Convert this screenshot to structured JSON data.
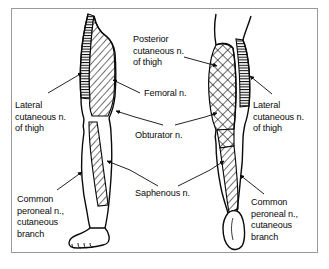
{
  "figure": {
    "view": "anterior and posterior views of both legs",
    "border_color": "#9a9a9a",
    "ink_color": "#0a0a0a",
    "background_color": "#ffffff"
  },
  "labels": {
    "posterior_cutaneous": {
      "line1": "Posterior",
      "line2": "cutaneous n.",
      "line3": "of thigh"
    },
    "lateral_cutaneous_left": {
      "line1": "Lateral",
      "line2": "cutaneous n.",
      "line3": "of thigh"
    },
    "lateral_cutaneous_right": {
      "line1": "Lateral",
      "line2": "cutaneous n.",
      "line3": "of thigh"
    },
    "femoral": {
      "line1": "Femoral n."
    },
    "obturator": {
      "line1": "Obturator n."
    },
    "saphenous": {
      "line1": "Saphenous n."
    },
    "common_peroneal_left": {
      "line1": "Common",
      "line2": "peroneal n.,",
      "line3": "cutaneous",
      "line4": "branch"
    },
    "common_peroneal_right": {
      "line1": "Common",
      "line2": "peroneal n.,",
      "line3": "cutaneous",
      "line4": "branch"
    }
  },
  "regions": [
    {
      "name": "left-thigh-lateral-band",
      "pattern": "horizontal-lines",
      "nerve": "Lateral cutaneous n. of thigh"
    },
    {
      "name": "left-thigh-femoral-area",
      "pattern": "diagonal-hatch",
      "nerve": "Femoral n."
    },
    {
      "name": "left-leg-saphenous-strip",
      "pattern": "diagonal-hatch",
      "nerve": "Saphenous n."
    },
    {
      "name": "right-thigh-posterior-area",
      "pattern": "cross-hatch",
      "nerve": "Posterior cutaneous n. of thigh"
    },
    {
      "name": "right-thigh-lateral-band",
      "pattern": "horizontal-lines",
      "nerve": "Lateral cutaneous n. of thigh"
    },
    {
      "name": "right-leg-saphenous-strip",
      "pattern": "diagonal-hatch",
      "nerve": "Saphenous n."
    }
  ]
}
